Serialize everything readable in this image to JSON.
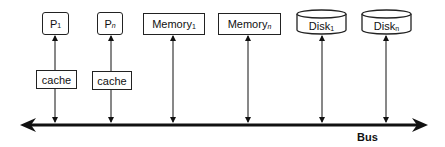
{
  "diagram": {
    "type": "shared-bus architecture",
    "bus": {
      "label": "Bus"
    },
    "processors": [
      {
        "name": "P",
        "subscript": "1",
        "cache_label": "cache"
      },
      {
        "name": "P",
        "subscript": "n",
        "cache_label": "cache"
      }
    ],
    "memories": [
      {
        "name": "Memory",
        "subscript": "1"
      },
      {
        "name": "Memory",
        "subscript": "n"
      }
    ],
    "disks": [
      {
        "name": "Disk",
        "subscript": "1"
      },
      {
        "name": "Disk",
        "subscript": "n"
      }
    ],
    "colors": {
      "stroke": "#111111",
      "background": "#ffffff"
    }
  }
}
